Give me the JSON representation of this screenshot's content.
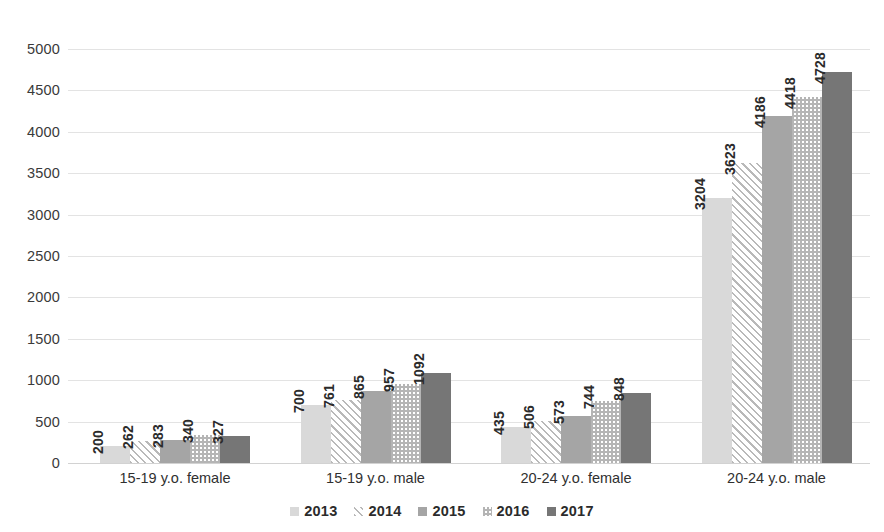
{
  "chart_data": {
    "type": "bar",
    "title": "",
    "subtitle": "",
    "xlabel": "",
    "ylabel": "",
    "ylim": [
      0,
      5000
    ],
    "ytick_step": 500,
    "yticks": [
      "0",
      "500",
      "1000",
      "1500",
      "2000",
      "2500",
      "3000",
      "3500",
      "4000",
      "4500",
      "5000"
    ],
    "grid": true,
    "legend_position": "bottom-center",
    "categories": [
      "15-19 y.o. female",
      "15-19 y.o. male",
      "20-24 y.o. female",
      "20-24 y.o. male"
    ],
    "series": [
      {
        "name": "2013",
        "values": [
          200,
          700,
          435,
          3204
        ],
        "fill": "solid-light-gray",
        "color": "#d9d9d9"
      },
      {
        "name": "2014",
        "values": [
          262,
          761,
          506,
          3623
        ],
        "fill": "diagonal-stripes",
        "color": "#b9b9b9"
      },
      {
        "name": "2015",
        "values": [
          283,
          865,
          573,
          4186
        ],
        "fill": "solid-medium-gray",
        "color": "#a5a5a5"
      },
      {
        "name": "2016",
        "values": [
          340,
          957,
          744,
          4418
        ],
        "fill": "checkerboard",
        "color": "#b5b5b5"
      },
      {
        "name": "2017",
        "values": [
          327,
          1092,
          848,
          4728
        ],
        "fill": "solid-dark-gray",
        "color": "#767676"
      }
    ]
  },
  "legend": {
    "items": [
      {
        "label": "2013"
      },
      {
        "label": "2014"
      },
      {
        "label": "2015"
      },
      {
        "label": "2016"
      },
      {
        "label": "2017"
      }
    ]
  }
}
